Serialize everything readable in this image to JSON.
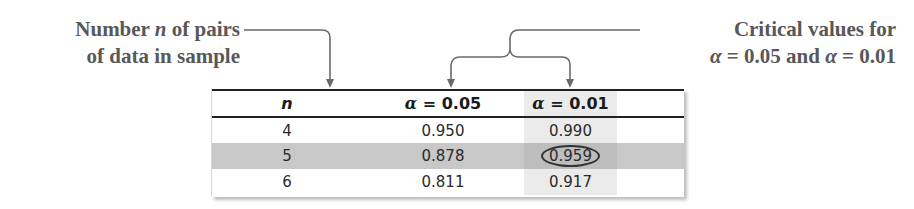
{
  "callouts": {
    "left": {
      "line1_pre": "Number ",
      "line1_var": "n",
      "line1_post": " of pairs",
      "line2": "of data in sample"
    },
    "right": {
      "line1": "Critical values for",
      "line2_a": "α",
      "line2_b": " = 0.05 and ",
      "line2_c": "α",
      "line2_d": " = 0.01"
    }
  },
  "table": {
    "headers": {
      "n": "n",
      "alpha05_sym": "α",
      "alpha05_val": " = 0.05",
      "alpha01_sym": "α",
      "alpha01_val": " = 0.01"
    },
    "rows": [
      {
        "n": "4",
        "a05": "0.950",
        "a01": "0.990"
      },
      {
        "n": "5",
        "a05": "0.878",
        "a01": "0.959",
        "highlighted": true,
        "circled": "a01"
      },
      {
        "n": "6",
        "a05": "0.811",
        "a01": "0.917"
      }
    ]
  },
  "colors": {
    "callout_text": "#585858",
    "arrow": "#6a6a6a",
    "highlight_row": "#c8c8c8",
    "rule": "#222222"
  }
}
